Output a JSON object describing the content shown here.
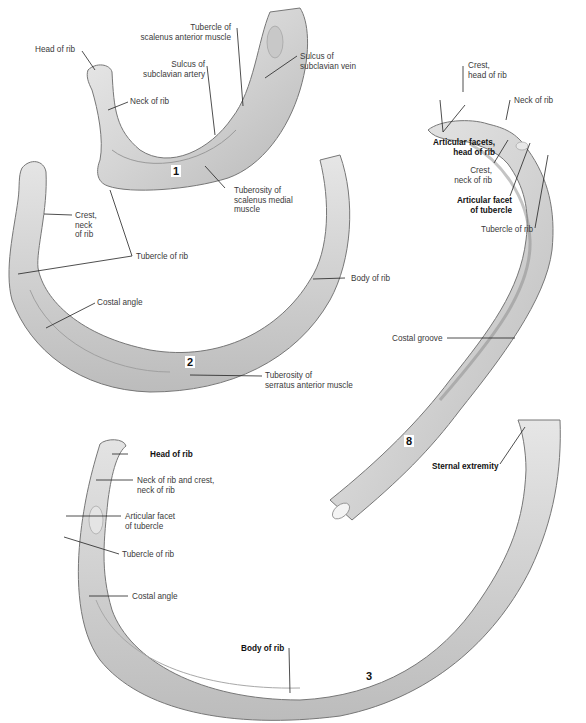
{
  "figure": {
    "ribs": [
      {
        "number": "1",
        "labels": [
          {
            "text": "Head of rib",
            "bold": false
          },
          {
            "text": "Neck of rib",
            "bold": false
          },
          {
            "text": "Tubercle of\nscalenus anterior muscle",
            "bold": false
          },
          {
            "text": "Sulcus of\nsubclavian artery",
            "bold": false
          },
          {
            "text": "Sulcus of\nsubclavian vein",
            "bold": false
          },
          {
            "text": "Tuberosity of\nscalenus medial\nmuscle",
            "bold": false
          }
        ]
      },
      {
        "number": "2",
        "labels": [
          {
            "text": "Crest,\nneck\nof rib",
            "bold": false
          },
          {
            "text": "Tubercle of rib",
            "bold": false
          },
          {
            "text": "Costal angle",
            "bold": false
          },
          {
            "text": "Body of rib",
            "bold": false
          },
          {
            "text": "Tuberosity of\nserratus anterior muscle",
            "bold": false
          }
        ]
      },
      {
        "number": "8",
        "labels": [
          {
            "text": "Crest,\nhead of rib",
            "bold": false
          },
          {
            "text": "Neck of rib",
            "bold": false
          },
          {
            "text": "Articular facets,\nhead of rib",
            "bold": true
          },
          {
            "text": "Crest,\nneck of rib",
            "bold": false
          },
          {
            "text": "Articular facet\nof tubercle",
            "bold": true
          },
          {
            "text": "Tubercle of rib",
            "bold": false
          },
          {
            "text": "Costal groove",
            "bold": false
          }
        ]
      },
      {
        "number": "3",
        "labels": [
          {
            "text": "Head of rib",
            "bold": true
          },
          {
            "text": "Neck of rib and crest,\nneck of rib",
            "bold": false
          },
          {
            "text": "Articular facet\nof tubercle",
            "bold": false
          },
          {
            "text": "Tubercle of rib",
            "bold": false
          },
          {
            "text": "Costal angle",
            "bold": false
          },
          {
            "text": "Sternal extremity",
            "bold": true
          },
          {
            "text": "Body of rib",
            "bold": true
          }
        ]
      }
    ]
  }
}
